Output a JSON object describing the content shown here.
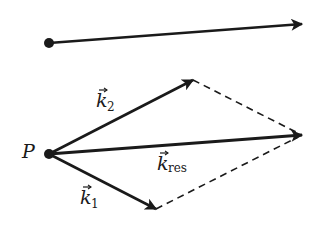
{
  "diagram": {
    "colors": {
      "ink": "#1a1a1a",
      "background": "#ffffff"
    },
    "top_vector": {
      "from": [
        49,
        43
      ],
      "to": [
        302,
        24
      ],
      "style": "solid"
    },
    "point": {
      "label": "P",
      "position": [
        49,
        154
      ]
    },
    "vectors": [
      {
        "id": "k2",
        "label_main": "k",
        "label_sub": "2",
        "from": [
          49,
          154
        ],
        "to": [
          193,
          80
        ],
        "style": "solid"
      },
      {
        "id": "kres",
        "label_main": "k",
        "label_sub": "res",
        "from": [
          49,
          154
        ],
        "to": [
          302,
          135
        ],
        "style": "solid"
      },
      {
        "id": "k1",
        "label_main": "k",
        "label_sub": "1",
        "from": [
          49,
          154
        ],
        "to": [
          156,
          209
        ],
        "style": "solid"
      }
    ],
    "dashed_lines": [
      {
        "from": [
          193,
          80
        ],
        "to": [
          302,
          135
        ]
      },
      {
        "from": [
          156,
          209
        ],
        "to": [
          302,
          135
        ]
      }
    ]
  }
}
